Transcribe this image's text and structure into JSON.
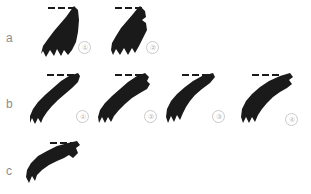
{
  "figure": {
    "background_color": "#ffffff",
    "silhouette_color": "#1a1a1a",
    "label_color": "#8d8d8d",
    "marker_color": "#b4b4b4",
    "width": 311,
    "height": 194
  },
  "rows": [
    {
      "label": "a",
      "label_x": 6,
      "label_y": 32,
      "specimens": [
        {
          "number": "①",
          "num_x": 78,
          "num_y": 41,
          "dash_x": 48,
          "dash_y": 7,
          "dash_count": 3,
          "x": 38,
          "y": 6,
          "w": 42,
          "h": 54,
          "points": "36,0 40,4 41,14 40,26 38,36 34,44 30,49 26,44 23,50 19,43 16,50 12,44 8,51 5,45 3,48 5,40 10,33 16,25 22,18 28,11 33,4"
        },
        {
          "number": "②",
          "num_x": 146,
          "num_y": 41,
          "dash_x": 115,
          "dash_y": 7,
          "dash_count": 3,
          "x": 106,
          "y": 6,
          "w": 44,
          "h": 54,
          "points": "34,0 39,5 40,11 36,14 40,17 41,24 37,32 33,40 29,47 26,42 22,49 18,42 14,49 10,43 7,49 5,44 6,37 10,30 15,22 21,15 27,8 31,3"
        }
      ]
    },
    {
      "label": "b",
      "label_x": 6,
      "label_y": 98,
      "specimens": [
        {
          "number": "①",
          "num_x": 76,
          "num_y": 110,
          "dash_x": 47,
          "dash_y": 74,
          "dash_count": 3,
          "x": 30,
          "y": 73,
          "w": 50,
          "h": 52,
          "points": "48,0 50,3 48,9 42,15 35,21 28,27 22,33 17,39 13,45 11,50 8,45 5,51 2,45 0,50 0,43 3,36 8,29 15,22 23,15 31,8 39,3"
        },
        {
          "number": "②",
          "num_x": 144,
          "num_y": 110,
          "dash_x": 115,
          "dash_y": 74,
          "dash_count": 3,
          "x": 98,
          "y": 73,
          "w": 52,
          "h": 52,
          "points": "47,0 51,4 49,8 52,11 49,16 42,20 34,25 27,31 21,37 16,43 13,49 10,44 7,50 4,44 1,50 0,44 2,37 7,30 14,23 22,16 30,9 39,3"
        },
        {
          "number": "③",
          "num_x": 212,
          "num_y": 110,
          "dash_x": 182,
          "dash_y": 74,
          "dash_count": 3,
          "x": 166,
          "y": 73,
          "w": 52,
          "h": 52,
          "points": "47,0 49,4 44,10 36,16 29,22 24,28 20,34 17,40 14,47 11,42 8,49 5,43 2,50 0,44 1,36 5,28 11,21 19,14 27,8 36,3"
        },
        {
          "number": "④",
          "num_x": 285,
          "num_y": 113,
          "dash_x": 252,
          "dash_y": 74,
          "dash_count": 3,
          "x": 240,
          "y": 73,
          "w": 54,
          "h": 52,
          "points": "50,0 53,4 49,7 52,11 47,15 40,19 33,24 27,30 22,36 18,42 15,49 12,44 9,50 6,44 3,50 1,44 2,36 6,28 12,21 20,14 29,8 40,3"
        }
      ]
    },
    {
      "label": "c",
      "label_x": 6,
      "label_y": 165,
      "specimens": [
        {
          "number": "",
          "num_x": 0,
          "num_y": 0,
          "dash_x": 50,
          "dash_y": 142,
          "dash_count": 3,
          "x": 26,
          "y": 141,
          "w": 54,
          "h": 47,
          "points": "51,0 54,4 50,7 52,12 47,17 43,14 38,17 31,20 23,24 16,29 11,34 9,40 6,35 3,42 0,36 1,29 5,22 12,15 21,10 31,5 42,2"
        }
      ]
    }
  ]
}
